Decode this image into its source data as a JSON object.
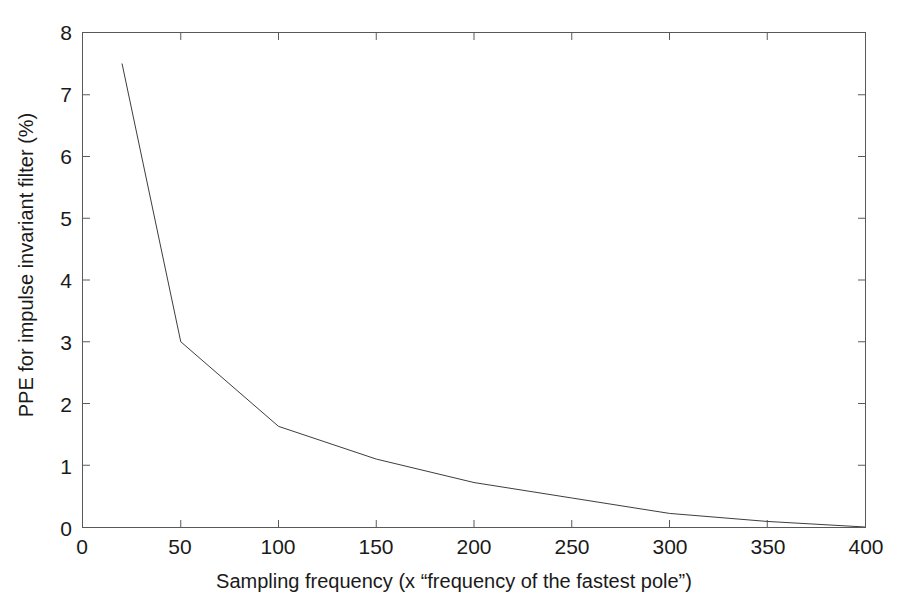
{
  "chart_data": {
    "type": "line",
    "title": "",
    "xlabel": "Sampling frequency (x “frequency of the fastest pole”)",
    "ylabel": "PPE for impulse invariant filter (%)",
    "xlim": [
      0,
      400
    ],
    "ylim": [
      0,
      8
    ],
    "xticks": [
      0,
      50,
      100,
      150,
      200,
      250,
      300,
      350,
      400
    ],
    "xticklabels": [
      "0",
      "50",
      "100",
      "150",
      "200",
      "250",
      "300",
      "350",
      "400"
    ],
    "yticks": [
      0,
      1,
      2,
      3,
      4,
      5,
      6,
      7,
      8
    ],
    "yticklabels": [
      "0",
      "1",
      "2",
      "3",
      "4",
      "5",
      "6",
      "7",
      "8"
    ],
    "grid": false,
    "legend": false,
    "legend_position": "none",
    "series": [
      {
        "name": "PPE for impulse invariant filter",
        "color": "#3c3c3c",
        "linewidth": 1,
        "marker": "none",
        "x": [
          20,
          50,
          100,
          150,
          200,
          250,
          300,
          350,
          400
        ],
        "y": [
          7.5,
          3.0,
          1.63,
          1.1,
          0.72,
          0.47,
          0.22,
          0.09,
          0.0
        ]
      }
    ],
    "annotations": []
  },
  "figure": {
    "background_color": "#ffffff",
    "axes_color": "#595959",
    "text_color": "#1a1a1a"
  }
}
